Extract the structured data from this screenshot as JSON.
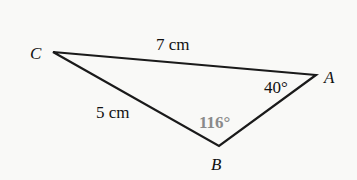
{
  "diagram": {
    "type": "triangle",
    "vertices": [
      {
        "name": "C",
        "x": 53,
        "y": 52
      },
      {
        "name": "A",
        "x": 316,
        "y": 75
      },
      {
        "name": "B",
        "x": 219,
        "y": 146
      }
    ],
    "labels": {
      "vertex_c": "C",
      "vertex_a": "A",
      "vertex_b": "B",
      "side_ca": "7 cm",
      "side_cb": "5 cm",
      "angle_a": "40°",
      "angle_b": "116°"
    },
    "colors": {
      "line": "#1a1a1a",
      "highlight_angle": "#8a8a8a",
      "background": "#f9f9f7"
    }
  }
}
